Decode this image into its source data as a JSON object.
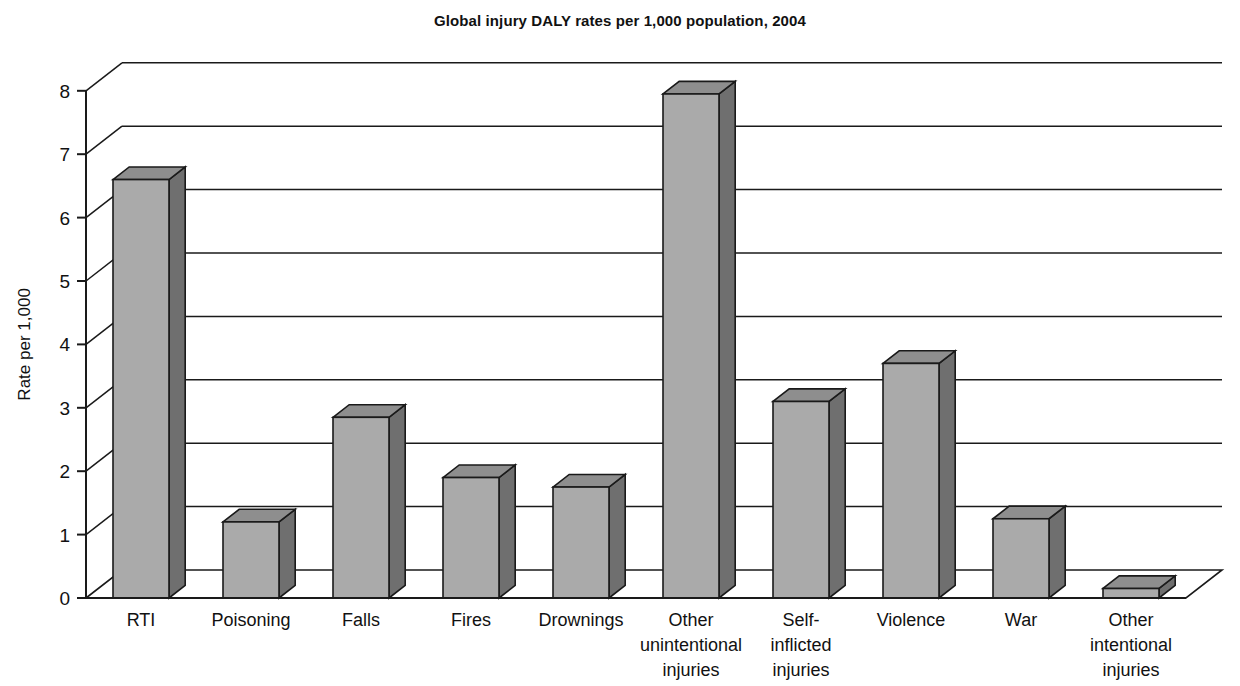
{
  "chart_data": {
    "type": "bar",
    "title": "Global injury DALY rates per 1,000 population, 2004",
    "xlabel": "",
    "ylabel": "Rate per 1,000",
    "ylim": [
      0,
      8
    ],
    "yticks": [
      "0",
      "1",
      "2",
      "3",
      "4",
      "5",
      "6",
      "7",
      "8"
    ],
    "grid": true,
    "legend": "none",
    "style": "3d-bars",
    "categories": [
      "RTI",
      "Poisoning",
      "Falls",
      "Fires",
      "Drownings",
      "Other unintentional injuries",
      "Self-inflicted injuries",
      "Violence",
      "War",
      "Other intentional injuries"
    ],
    "category_label_lines": [
      [
        "RTI"
      ],
      [
        "Poisoning"
      ],
      [
        "Falls"
      ],
      [
        "Fires"
      ],
      [
        "Drownings"
      ],
      [
        "Other",
        "unintentional",
        "injuries"
      ],
      [
        "Self-",
        "inflicted",
        "injuries"
      ],
      [
        "Violence"
      ],
      [
        "War"
      ],
      [
        "Other",
        "intentional",
        "injuries"
      ]
    ],
    "values": [
      6.6,
      1.2,
      2.85,
      1.9,
      1.75,
      7.95,
      3.1,
      3.7,
      1.25,
      0.15
    ]
  },
  "colors": {
    "bar_front": "#aaaaaa",
    "bar_top": "#8e8e8e",
    "bar_side": "#6f6f6f",
    "outline": "#1a1a1a",
    "axis": "#1a1a1a",
    "background": "#ffffff",
    "text": "#111111"
  }
}
